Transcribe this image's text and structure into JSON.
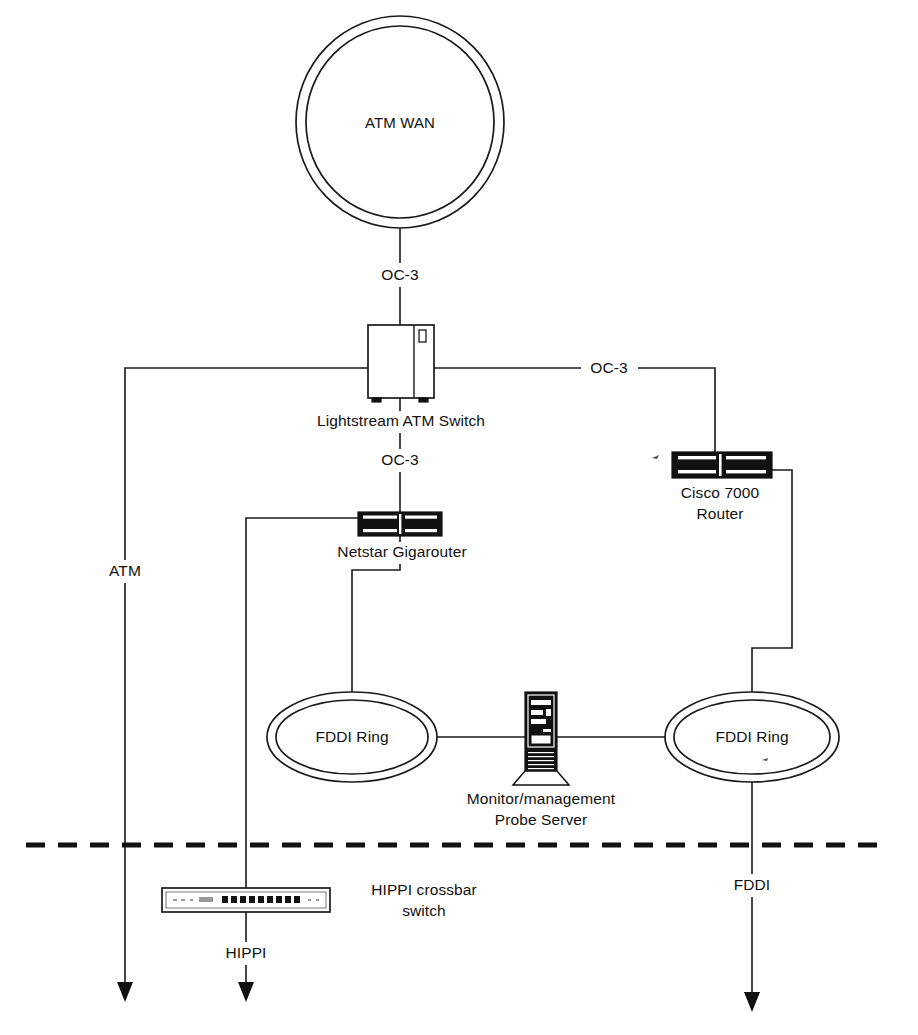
{
  "diagram": {
    "nodes": {
      "atm_wan": {
        "label": "ATM WAN",
        "type": "cloud-double-circle"
      },
      "lightstream": {
        "label": "Lightstream ATM Switch",
        "type": "atm-switch-cabinet"
      },
      "netstar": {
        "label": "Netstar Gigarouter",
        "type": "router-chassis"
      },
      "cisco": {
        "label_line1": "Cisco 7000",
        "label_line2": "Router",
        "type": "router-chassis"
      },
      "fddi_ring_left": {
        "label": "FDDI Ring",
        "type": "ring-double-ellipse"
      },
      "fddi_ring_right": {
        "label": "FDDI Ring",
        "type": "ring-double-ellipse"
      },
      "probe_server": {
        "label_line1": "Monitor/management",
        "label_line2": "Probe Server",
        "type": "tower-server"
      },
      "hippi_switch": {
        "label_line1": "HIPPI crossbar",
        "label_line2": "switch",
        "type": "crossbar-switch"
      }
    },
    "link_labels": {
      "oc3_wan_to_switch": "OC-3",
      "oc3_switch_to_router": "OC-3",
      "oc3_switch_to_netstar": "OC-3",
      "atm_downlink": "ATM",
      "hippi_downlink": "HIPPI",
      "fddi_downlink": "FDDI"
    },
    "colors": {
      "line": "#1a1a1a",
      "text": "#111111",
      "chassis_dark": "#111111",
      "background": "#ffffff"
    }
  }
}
